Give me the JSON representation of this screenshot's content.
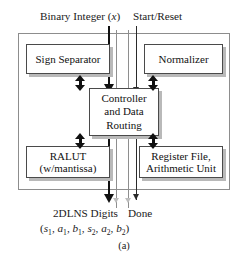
{
  "figure": {
    "caption": "(a)"
  },
  "top_signals": [
    {
      "name": "binary-integer",
      "label_prefix": "Binary Integer (",
      "label_var": "x",
      "label_suffix": ")"
    },
    {
      "name": "start-reset",
      "label": "Start/Reset"
    }
  ],
  "blocks": [
    {
      "id": "sign-separator",
      "lines": [
        "Sign Separator"
      ]
    },
    {
      "id": "normalizer",
      "lines": [
        "Normalizer"
      ]
    },
    {
      "id": "controller",
      "lines": [
        "Controller",
        "and Data",
        "Routing"
      ]
    },
    {
      "id": "ralut",
      "lines": [
        "RALUT",
        "(w/mantissa)"
      ]
    },
    {
      "id": "register-file",
      "lines": [
        "Register File,",
        "Arithmetic Unit"
      ]
    }
  ],
  "block_text": {
    "sign_separator": "Sign Separator",
    "normalizer": "Normalizer",
    "controller_l1": "Controller",
    "controller_l2": "and Data",
    "controller_l3": "Routing",
    "ralut_l1": "RALUT",
    "ralut_l2": "(w/mantissa)",
    "regfile_l1": "Register File,",
    "regfile_l2": "Arithmetic Unit"
  },
  "labels": {
    "binary_integer_pre": "Binary Integer (",
    "binary_integer_var": "x",
    "binary_integer_post": ")",
    "start_reset": "Start/Reset",
    "output_digits": "2DLNS Digits",
    "done": "Done"
  },
  "formula": {
    "open": "(",
    "terms": [
      {
        "sym": "s",
        "sub": "1"
      },
      {
        "sym": "a",
        "sub": "1"
      },
      {
        "sym": "b",
        "sub": "1"
      },
      {
        "sym": "s",
        "sub": "2"
      },
      {
        "sym": "a",
        "sub": "2"
      },
      {
        "sym": "b",
        "sub": "2"
      }
    ],
    "close": ")",
    "separator": ", ",
    "plain": "(s1, a1, b1, s2, a2, b2)"
  },
  "colors": {
    "line": "#111111",
    "faint_line": "#8e8e8e",
    "block_border": "#4a4a4a",
    "frame_border": "#8d8d8d",
    "shadow": "#b9b9b9",
    "background": "#ffffff"
  }
}
